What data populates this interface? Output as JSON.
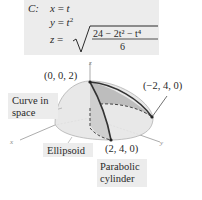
{
  "equation": {
    "curve_label": "C:",
    "x_lhs": "x",
    "x_eq": "=",
    "x_rhs": "t",
    "y_lhs": "y",
    "y_eq": "=",
    "y_rhs": "t",
    "y_rhs_exp": "2",
    "z_lhs": "z",
    "z_eq": "=",
    "z_numerator": "24 − 2t² − t⁴",
    "z_denominator": "6"
  },
  "figure": {
    "axis_x": "x",
    "axis_y": "y",
    "axis_z": "z",
    "point_top": "(0, 0, 2)",
    "point_right": "(−2, 4, 0)",
    "point_bottom": "(2, 4, 0)",
    "label_curve": [
      "Curve in",
      "space"
    ],
    "label_ellipsoid": "Ellipsoid",
    "label_cylinder": [
      "Parabolic",
      "cylinder"
    ]
  },
  "colors": {
    "label_bg": "#ececec",
    "surface_fill": "#e4e4e4",
    "cylinder_fill": "#bdbdbd",
    "curve": "#333333"
  }
}
